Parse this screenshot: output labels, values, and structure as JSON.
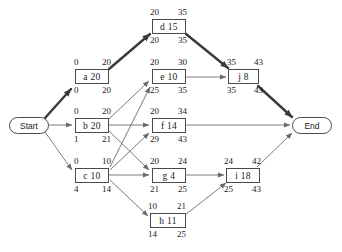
{
  "diagram": {
    "type": "activity-on-node-network",
    "title": "",
    "start_node": {
      "label": "Start"
    },
    "end_node": {
      "label": "End"
    },
    "activities": [
      {
        "id": "d",
        "label": "d 15",
        "name": "d",
        "duration": 15,
        "early_start": 20,
        "early_finish": 35,
        "late_start": 20,
        "late_finish": 35,
        "slack": 0,
        "critical": true
      },
      {
        "id": "a",
        "label": "a 20",
        "name": "a",
        "duration": 20,
        "early_start": 0,
        "early_finish": 20,
        "late_start": 0,
        "late_finish": 20,
        "slack": 0,
        "critical": true
      },
      {
        "id": "e",
        "label": "e 10",
        "name": "e",
        "duration": 10,
        "early_start": 20,
        "early_finish": 30,
        "late_start": 25,
        "late_finish": 35,
        "slack": 5,
        "critical": false
      },
      {
        "id": "j",
        "label": "j 8",
        "name": "j",
        "duration": 8,
        "early_start": 35,
        "early_finish": 43,
        "late_start": 35,
        "late_finish": 43,
        "slack": 0,
        "critical": true
      },
      {
        "id": "b",
        "label": "b 20",
        "name": "b",
        "duration": 20,
        "early_start": 0,
        "early_finish": 20,
        "late_start": 1,
        "late_finish": 21,
        "slack": 1,
        "critical": false
      },
      {
        "id": "f",
        "label": "f 14",
        "name": "f",
        "duration": 14,
        "early_start": 20,
        "early_finish": 34,
        "late_start": 29,
        "late_finish": 43,
        "slack": 9,
        "critical": false
      },
      {
        "id": "c",
        "label": "c 10",
        "name": "c",
        "duration": 10,
        "early_start": 0,
        "early_finish": 10,
        "late_start": 4,
        "late_finish": 14,
        "slack": 4,
        "critical": false
      },
      {
        "id": "g",
        "label": "g 4",
        "name": "g",
        "duration": 4,
        "early_start": 20,
        "early_finish": 24,
        "late_start": 21,
        "late_finish": 25,
        "slack": 1,
        "critical": false
      },
      {
        "id": "i",
        "label": "i 18",
        "name": "i",
        "duration": 18,
        "early_start": 24,
        "early_finish": 42,
        "late_start": 25,
        "late_finish": 43,
        "slack": 1,
        "critical": false
      },
      {
        "id": "h",
        "label": "h 11",
        "name": "h",
        "duration": 11,
        "early_start": 10,
        "early_finish": 21,
        "late_start": 14,
        "late_finish": 25,
        "slack": 4,
        "critical": false
      }
    ],
    "edges": [
      {
        "from": "Start",
        "to": "a",
        "critical": true
      },
      {
        "from": "Start",
        "to": "b",
        "critical": false
      },
      {
        "from": "Start",
        "to": "c",
        "critical": false
      },
      {
        "from": "a",
        "to": "d",
        "critical": true
      },
      {
        "from": "d",
        "to": "j",
        "critical": true
      },
      {
        "from": "b",
        "to": "e",
        "critical": false
      },
      {
        "from": "b",
        "to": "f",
        "critical": false
      },
      {
        "from": "b",
        "to": "g",
        "critical": false
      },
      {
        "from": "c",
        "to": "e",
        "critical": false
      },
      {
        "from": "c",
        "to": "f",
        "critical": false
      },
      {
        "from": "c",
        "to": "g",
        "critical": false
      },
      {
        "from": "c",
        "to": "h",
        "critical": false
      },
      {
        "from": "e",
        "to": "j",
        "critical": false
      },
      {
        "from": "f",
        "to": "End",
        "critical": false
      },
      {
        "from": "g",
        "to": "i",
        "critical": false
      },
      {
        "from": "h",
        "to": "i",
        "critical": false
      },
      {
        "from": "i",
        "to": "End",
        "critical": false
      },
      {
        "from": "j",
        "to": "End",
        "critical": true
      }
    ],
    "colors": {
      "line": "#6b6b6b",
      "critical_line": "#3a3a3a",
      "box_border": "#4a4a4a",
      "text": "#1a1a1a",
      "background": "#ffffff"
    }
  }
}
